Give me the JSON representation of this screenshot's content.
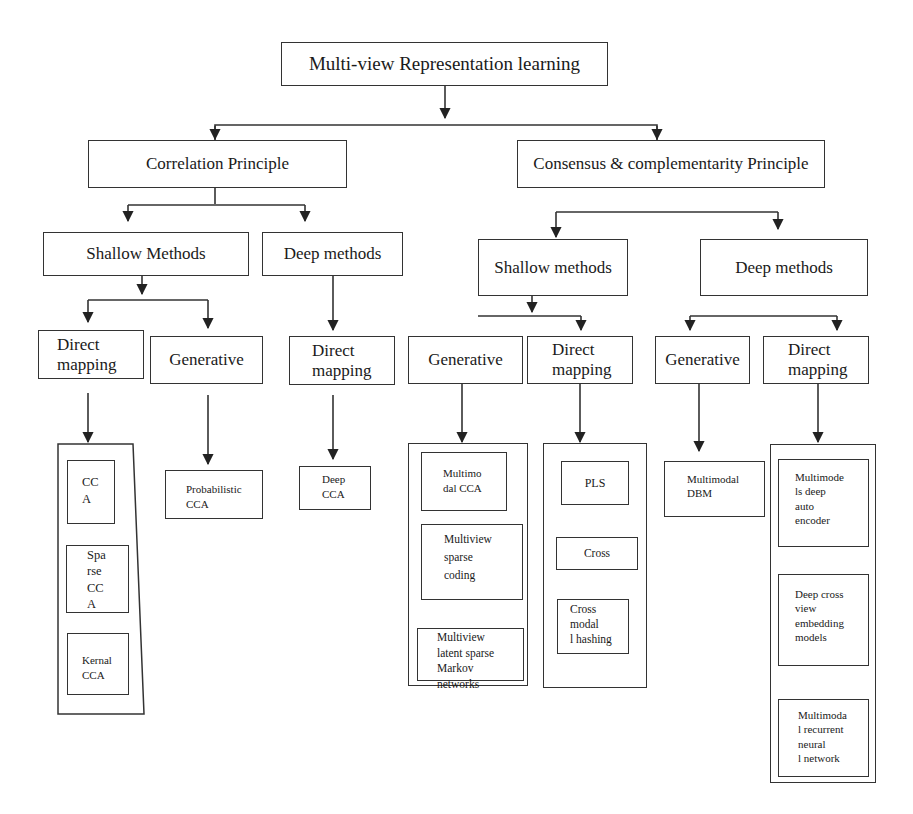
{
  "diagram": {
    "title": "Multi-view Representation learning",
    "principles": {
      "correlation": {
        "label": "Correlation Principle",
        "shallow": {
          "label": "Shallow Methods",
          "direct_mapping": {
            "label": "Direct\nmapping",
            "methods": [
              "CC\nA",
              "Spa\nrse\nCC\nA",
              "Kernal\nCCA"
            ]
          },
          "generative": {
            "label": "Generative",
            "methods": [
              "Probabilistic\nCCA"
            ]
          }
        },
        "deep": {
          "label": "Deep methods",
          "direct_mapping": {
            "label": "Direct\nmapping",
            "methods": [
              "Deep\nCCA"
            ]
          }
        }
      },
      "consensus": {
        "label": "Consensus & complementarity Principle",
        "shallow": {
          "label": "Shallow methods",
          "generative": {
            "label": "Generative",
            "methods": [
              "Multimo\ndal CCA",
              "Multiview\nsparse\ncoding",
              "Multiview\nlatent  sparse\nMarkov\nnetworks"
            ]
          },
          "direct_mapping": {
            "label": "Direct\nmapping",
            "methods": [
              "PLS",
              "Cross",
              "Cross\nmodal\nl hashing"
            ]
          }
        },
        "deep": {
          "label": "Deep methods",
          "generative": {
            "label": "Generative",
            "methods": [
              "Multimodal\nDBM"
            ]
          },
          "direct_mapping": {
            "label": "Direct\nmapping",
            "methods": [
              "Multimode\nls      deep\nauto\nencoder",
              "Deep cross\nview\nembedding\nmodels",
              "Multimoda\nl  recurrent\nneural\nl network"
            ]
          }
        }
      }
    },
    "colors": {
      "line": "#333333",
      "text": "#1a1a1a",
      "background": "#ffffff"
    }
  }
}
